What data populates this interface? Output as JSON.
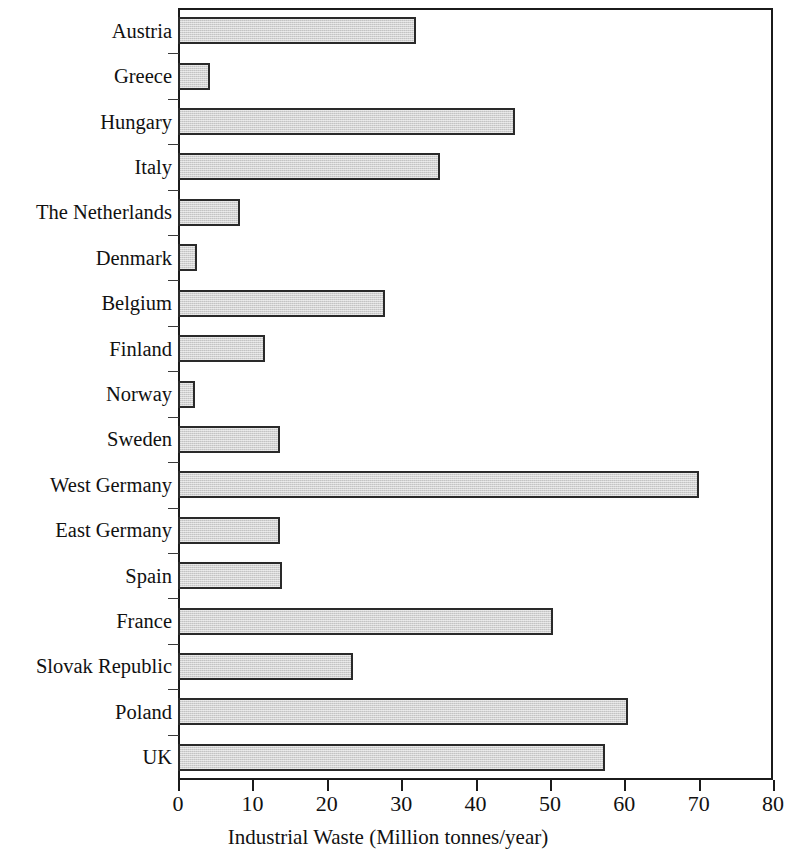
{
  "chart_data": {
    "type": "bar",
    "orientation": "horizontal",
    "title": "",
    "xlabel": "Industrial Waste (Million tonnes/year)",
    "ylabel": "",
    "xlim": [
      0,
      80
    ],
    "xticks": [
      0,
      10,
      20,
      30,
      40,
      50,
      60,
      70,
      80
    ],
    "grid": false,
    "legend": null,
    "bar_fill_color": "#d2d2d2",
    "bar_edge_color": "#2a2a2a",
    "categories": [
      "Austria",
      "Greece",
      "Hungary",
      "Italy",
      "The Netherlands",
      "Denmark",
      "Belgium",
      "Finland",
      "Norway",
      "Sweden",
      "West Germany",
      "East Germany",
      "Spain",
      "France",
      "Slovak Republic",
      "Poland",
      "UK"
    ],
    "values": [
      32,
      4.3,
      45.3,
      35.2,
      8.3,
      2.5,
      27.8,
      11.7,
      2.3,
      13.7,
      70,
      13.7,
      14,
      50.4,
      23.5,
      60.5,
      57.4
    ]
  }
}
